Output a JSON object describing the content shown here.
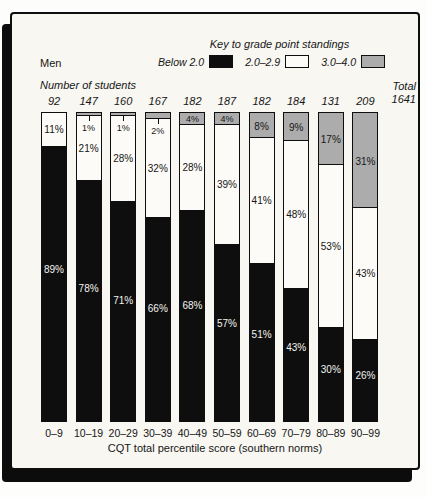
{
  "header": {
    "group_label": "Men",
    "key_title": "Key to grade point standings",
    "legend": [
      {
        "label": "Below 2.0",
        "color": "#0e0e0e"
      },
      {
        "label": "2.0–2.9",
        "color": "#fcfbf7"
      },
      {
        "label": "3.0–4.0",
        "color": "#acacac"
      }
    ],
    "counts_title": "Number of students",
    "total_label": "Total",
    "total_value": "1641"
  },
  "chart_data": {
    "type": "bar",
    "stacked": true,
    "unit": "percent",
    "title": "Key to grade point standings",
    "group": "Men",
    "xlabel": "CQT total percentile score (southern norms)",
    "ylim": [
      0,
      100
    ],
    "grid": false,
    "legend_position": "top",
    "categories": [
      "0–9",
      "10–19",
      "20–29",
      "30–39",
      "40–49",
      "50–59",
      "60–69",
      "70–79",
      "80–89",
      "90–99"
    ],
    "counts": [
      92,
      147,
      160,
      167,
      182,
      187,
      182,
      184,
      131,
      209
    ],
    "total_students": 1641,
    "series": [
      {
        "name": "Below 2.0",
        "color": "#0e0e0e",
        "values": [
          89,
          78,
          71,
          66,
          68,
          57,
          51,
          43,
          30,
          26
        ]
      },
      {
        "name": "2.0–2.9",
        "color": "#fcfbf7",
        "values": [
          11,
          21,
          28,
          32,
          28,
          39,
          41,
          48,
          53,
          43
        ]
      },
      {
        "name": "3.0–4.0",
        "color": "#acacac",
        "values": [
          0,
          1,
          1,
          2,
          4,
          4,
          8,
          9,
          17,
          31
        ]
      }
    ]
  },
  "axis": {
    "ticks": [
      "0–9",
      "10–19",
      "20–29",
      "30–39",
      "40–49",
      "50–59",
      "60–69",
      "70–79",
      "80–89",
      "90–99"
    ],
    "title": "CQT total percentile score (southern norms)"
  }
}
